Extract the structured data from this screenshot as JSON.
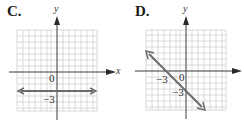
{
  "panels": [
    {
      "label": "C.",
      "x_axis_label": "x",
      "y_axis_label": "y",
      "origin_label": "0",
      "tick_labels": [
        "−3"
      ],
      "line": {
        "type": "horizontal",
        "equation": "y = -3",
        "y_intercept": -3
      }
    },
    {
      "label": "D.",
      "y_axis_label": "y",
      "origin_label": "0",
      "tick_labels": [
        "−3",
        "−3"
      ],
      "line": {
        "type": "slanted",
        "equation": "y = -x - 3",
        "x_intercept": -3,
        "y_intercept": -3,
        "slope": -1
      }
    }
  ],
  "colors": {
    "grid": "#d0d0d0",
    "axis": "#3a3a3a",
    "line": "#6a6a6a",
    "text": "#1a1a1a"
  }
}
